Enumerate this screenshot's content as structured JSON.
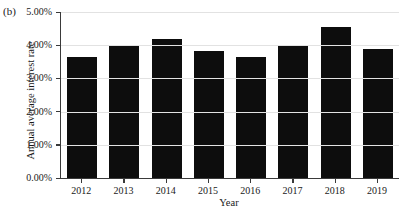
{
  "panel": {
    "label": "(b)"
  },
  "chart_data": {
    "type": "bar",
    "title": "",
    "subtitle": "",
    "xlabel": "Year",
    "ylabel": "Annual average interest rate",
    "categories": [
      "2012",
      "2013",
      "2014",
      "2015",
      "2016",
      "2017",
      "2018",
      "2019"
    ],
    "values": [
      3.63,
      3.97,
      4.18,
      3.82,
      3.65,
      3.97,
      4.55,
      3.9
    ],
    "value_labels": [
      "3.63%",
      "3.97%",
      "4.18%",
      "3.82%",
      "3.65%",
      "3.97%",
      "4.55%",
      "3.90%"
    ],
    "ylim": [
      0,
      5
    ],
    "ytick_values": [
      0,
      1,
      2,
      3,
      4,
      5
    ],
    "ytick_labels": [
      "0.00%",
      "1.00%",
      "2.00%",
      "3.00%",
      "4.00%",
      "5.00%"
    ],
    "grid": true,
    "grid_axis": "y",
    "legend": false,
    "legend_position": "none",
    "bar_color": "#0d0d0d",
    "grid_color": "#e2e2e2",
    "axis_color": "#3a3a3a"
  }
}
